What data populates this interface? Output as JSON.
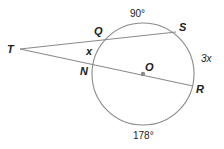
{
  "diagram": {
    "type": "circle-secants-geometry",
    "circle": {
      "center_label": "O",
      "color": "#8a8a8a"
    },
    "points": {
      "T": "T",
      "Q": "Q",
      "S": "S",
      "N": "N",
      "O": "O",
      "R": "R"
    },
    "arcs": {
      "QS": "90°",
      "SR": "3x",
      "NR_lower": "178°",
      "QN": "x"
    },
    "segments": [
      "TS",
      "TR"
    ],
    "colors": {
      "line": "#8a8a8a",
      "text": "#222222",
      "center_dot": "#8a8a8a"
    }
  }
}
